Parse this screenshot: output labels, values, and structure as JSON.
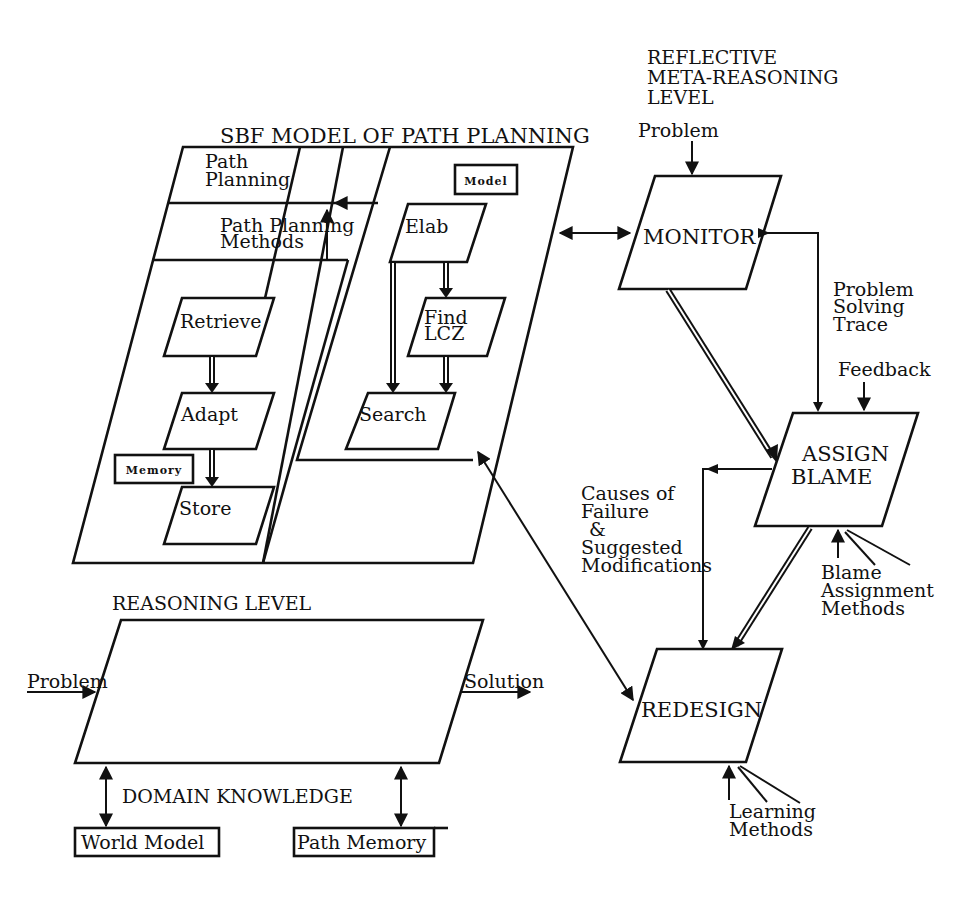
{
  "diagram": {
    "meta_level": {
      "title_lines": [
        "REFLECTIVE",
        "META-REASONING",
        "LEVEL"
      ],
      "problem_input": "Problem",
      "monitor": "MONITOR",
      "assign_blame": [
        "ASSIGN",
        "BLAME"
      ],
      "redesign": "REDESIGN",
      "problem_solving_trace": [
        "Problem",
        "Solving",
        "Trace"
      ],
      "feedback": "Feedback",
      "causes_label": [
        "Causes of",
        "Failure",
        "&",
        "Suggested",
        "Modifications"
      ],
      "blame_methods": [
        "Blame",
        "Assignment",
        "Methods"
      ],
      "learning_methods": [
        "Learning",
        "Methods"
      ]
    },
    "sbf_model": {
      "title": "SBF MODEL OF PATH PLANNING",
      "path_planning": [
        "Path",
        "Planning"
      ],
      "path_planning_methods": [
        "Path Planning",
        "Methods"
      ],
      "model_tag": "Model",
      "memory_tag": "Memory",
      "memory_tasks": [
        "Retrieve",
        "Adapt",
        "Store"
      ],
      "model_tasks": [
        "Elab",
        "Find",
        "LCZ",
        "Search"
      ]
    },
    "reasoning_level": {
      "title": "REASONING LEVEL",
      "input": "Problem",
      "output": "Solution"
    },
    "domain_knowledge": {
      "title": "DOMAIN KNOWLEDGE",
      "stores": [
        "World Model",
        "Path Memory"
      ]
    }
  }
}
